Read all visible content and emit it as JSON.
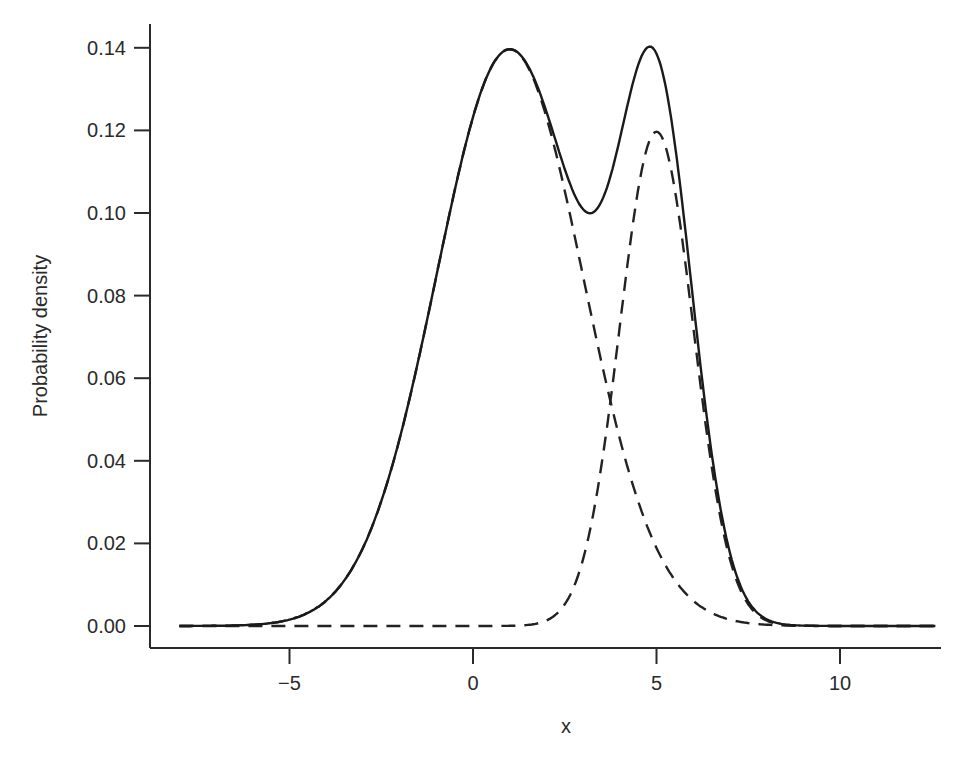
{
  "chart_data": {
    "type": "line",
    "title": "",
    "xlabel": "x",
    "ylabel": "Probability density",
    "xlim": [
      -8.6,
      12.6
    ],
    "ylim": [
      -0.005,
      0.145
    ],
    "grid": false,
    "legend": null,
    "x_ticks": [
      -5,
      0,
      5,
      10
    ],
    "x_tick_labels": [
      "−5",
      "0",
      "5",
      "10"
    ],
    "y_ticks": [
      0.0,
      0.02,
      0.04,
      0.06,
      0.08,
      0.1,
      0.12,
      0.14
    ],
    "y_tick_labels": [
      "0.00",
      "0.02",
      "0.04",
      "0.06",
      "0.08",
      "0.10",
      "0.12",
      "0.14"
    ],
    "series": [
      {
        "name": "mixture density",
        "style": "solid",
        "description": "Sum of two weighted normal components",
        "x": [
          -8,
          -6,
          -5,
          -4,
          -3,
          -2,
          -1,
          0,
          1,
          2,
          3,
          3.2,
          4,
          4.8,
          5,
          6,
          7,
          8,
          10,
          12.6
        ],
        "values": [
          0.0,
          0.0004,
          0.0016,
          0.0061,
          0.019,
          0.0455,
          0.0849,
          0.1236,
          0.14,
          0.1241,
          0.0887,
          0.1004,
          0.129,
          0.141,
          0.1395,
          0.1062,
          0.0364,
          0.0063,
          0.0001,
          0.0
        ]
      },
      {
        "name": "component 1",
        "style": "dashed",
        "mean": 1,
        "sd": 2.0,
        "weight": 0.7,
        "x": [
          -8,
          -6,
          -5,
          -4,
          -3,
          -2,
          -1,
          0,
          1,
          2,
          3,
          4,
          5,
          6,
          7,
          8,
          10,
          12.6
        ],
        "values": [
          0.0,
          0.0003,
          0.0016,
          0.0061,
          0.019,
          0.0454,
          0.0849,
          0.1236,
          0.14,
          0.1236,
          0.0849,
          0.0454,
          0.019,
          0.0061,
          0.0016,
          0.0003,
          0.0,
          0.0
        ]
      },
      {
        "name": "component 2",
        "style": "dashed",
        "mean": 5,
        "sd": 1.0,
        "weight": 0.3,
        "x": [
          -8,
          0,
          2,
          3,
          4,
          5,
          6,
          7,
          8,
          10,
          12.6
        ],
        "values": [
          0.0,
          0.0,
          0.0013,
          0.0162,
          0.0728,
          0.12,
          0.0728,
          0.0162,
          0.0013,
          0.0,
          0.0
        ]
      }
    ]
  },
  "axes": {
    "xlabel": "x",
    "ylabel": "Probability density"
  }
}
